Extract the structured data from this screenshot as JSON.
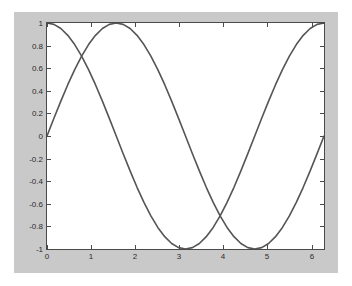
{
  "figure": {
    "page_background": "#ffffff",
    "panel_background": "#c9c9c9",
    "axes_background": "#ffffff",
    "axes_border_color": "#4a4a4a",
    "tick_color": "#4a4a4a",
    "label_color": "#2b2b2b"
  },
  "chart_data": {
    "type": "line",
    "title": "",
    "subtitle": "",
    "xlabel": "",
    "ylabel": "",
    "xlim": [
      0,
      6.2832
    ],
    "ylim": [
      -1,
      1
    ],
    "grid": false,
    "legend": null,
    "legend_position": "none",
    "box": true,
    "tick_direction": "in",
    "xticks": [
      0,
      1,
      2,
      3,
      4,
      5,
      6
    ],
    "xticklabels": [
      "0",
      "1",
      "2",
      "3",
      "4",
      "5",
      "6"
    ],
    "yticks": [
      1,
      0.8,
      0.6,
      0.4,
      0.2,
      0,
      -0.2,
      -0.4,
      -0.6,
      -0.8,
      -1
    ],
    "yticklabels": [
      "1",
      "0.8",
      "0.6",
      "0.4",
      "0.2",
      "0",
      "-0.2",
      "-0.4",
      "-0.6",
      "-0.8",
      "-1"
    ],
    "x": [
      0,
      0.1571,
      0.3142,
      0.4712,
      0.6283,
      0.7854,
      0.9425,
      1.0996,
      1.2566,
      1.4137,
      1.5708,
      1.7279,
      1.885,
      2.042,
      2.1991,
      2.3562,
      2.5133,
      2.6704,
      2.8274,
      2.9845,
      3.1416,
      3.2987,
      3.4558,
      3.6128,
      3.7699,
      3.927,
      4.0841,
      4.2412,
      4.3982,
      4.5553,
      4.7124,
      4.8695,
      5.0265,
      5.1836,
      5.3407,
      5.4978,
      5.6549,
      5.8119,
      5.969,
      6.1261,
      6.2832
    ],
    "series": [
      {
        "name": "cos(x)",
        "color": "#555555",
        "linewidth": 1,
        "values": [
          1.0,
          0.9877,
          0.9511,
          0.891,
          0.809,
          0.7071,
          0.5878,
          0.454,
          0.309,
          0.1564,
          0.0,
          -0.1564,
          -0.309,
          -0.454,
          -0.5878,
          -0.7071,
          -0.809,
          -0.891,
          -0.9511,
          -0.9877,
          -1.0,
          -0.9877,
          -0.9511,
          -0.891,
          -0.809,
          -0.7071,
          -0.5878,
          -0.454,
          -0.309,
          -0.1564,
          0.0,
          0.1564,
          0.309,
          0.454,
          0.5878,
          0.7071,
          0.809,
          0.891,
          0.9511,
          0.9877,
          1.0
        ]
      },
      {
        "name": "sin(x)",
        "color": "#555555",
        "linewidth": 1,
        "values": [
          0.0,
          0.1564,
          0.309,
          0.454,
          0.5878,
          0.7071,
          0.809,
          0.891,
          0.9511,
          0.9877,
          1.0,
          0.9877,
          0.9511,
          0.891,
          0.809,
          0.7071,
          0.5878,
          0.454,
          0.309,
          0.1564,
          0.0,
          -0.1564,
          -0.309,
          -0.454,
          -0.5878,
          -0.7071,
          -0.809,
          -0.891,
          -0.9511,
          -0.9877,
          -1.0,
          -0.9877,
          -0.9511,
          -0.891,
          -0.809,
          -0.7071,
          -0.5878,
          -0.454,
          -0.309,
          -0.1564,
          0.0
        ]
      }
    ],
    "annotations": []
  }
}
